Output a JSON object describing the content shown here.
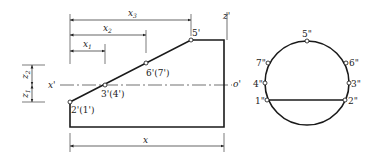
{
  "front_view": {
    "dimensions": {
      "x3": "x",
      "x3_sub": "3",
      "x2": "x",
      "x2_sub": "2",
      "x1": "x",
      "x1_sub": "1",
      "x": "x",
      "z2": "z",
      "z2_sub": "2",
      "z1": "z",
      "z1_sub": "1"
    },
    "axis_labels": {
      "left": "x'",
      "right": "o'",
      "top": "z'"
    },
    "points": {
      "p5": "5'",
      "p67": "6'(7')",
      "p34": "3'(4')",
      "p21": "2'(1')"
    }
  },
  "side_view": {
    "points": {
      "p5": "5\"",
      "p7": "7\"",
      "p6": "6\"",
      "p4": "4\"",
      "p3": "3\"",
      "p1": "1\"",
      "p2": "2\""
    }
  },
  "colors": {
    "line": "#1a1a1a",
    "thin": "#333333"
  }
}
